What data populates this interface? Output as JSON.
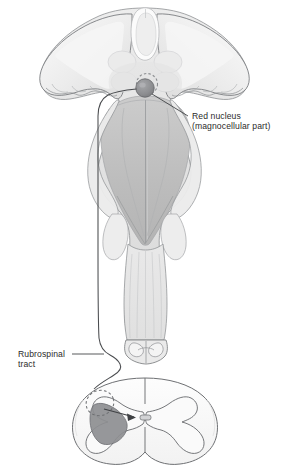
{
  "figure": {
    "background_color": "#ffffff"
  },
  "labels": {
    "red_nucleus": {
      "line1": "Red nucleus",
      "line2": "(magnocellular part)"
    },
    "rubrospinal": {
      "line1": "Rubrospinal",
      "line2": "tract"
    }
  },
  "colors": {
    "outline": "#6b6d70",
    "outline_soft": "#9ea0a3",
    "fill_lightest": "#f4f4f4",
    "fill_light": "#e6e6e6",
    "fill_mid": "#d6d6d6",
    "fill_mid2": "#c9c9c9",
    "fill_dark": "#b8b8b8",
    "nucleus_fill": "#8f9093",
    "nucleus_stroke": "#6a6b6e",
    "tract_line": "#4a4c4f",
    "text": "#2b2b2b",
    "horn_shade": "#8e8f92"
  },
  "structures": [
    {
      "name": "thalamus-left-lobe",
      "region": "upper-left"
    },
    {
      "name": "thalamus-right-lobe",
      "region": "upper-right"
    },
    {
      "name": "pineal-midline-body",
      "region": "top-center"
    },
    {
      "name": "colliculi",
      "region": "upper-center"
    },
    {
      "name": "fourth-ventricle-floor",
      "region": "center"
    },
    {
      "name": "cerebellar-peduncle-left",
      "region": "mid-left"
    },
    {
      "name": "cerebellar-peduncle-right",
      "region": "mid-right"
    },
    {
      "name": "medulla",
      "region": "lower-center"
    },
    {
      "name": "medulla-cut-surface",
      "region": "lower-center"
    },
    {
      "name": "red-nucleus-marker",
      "region": "upper-center-right"
    },
    {
      "name": "rubrospinal-tract-line",
      "region": "left-descending"
    },
    {
      "name": "spinal-cord-cross-section",
      "region": "bottom"
    },
    {
      "name": "ventral-horn-shaded",
      "region": "bottom-left-quadrant"
    },
    {
      "name": "lateral-funiculus-dashed-marker",
      "region": "bottom-left"
    },
    {
      "name": "projection-arrow",
      "region": "bottom-center"
    }
  ]
}
